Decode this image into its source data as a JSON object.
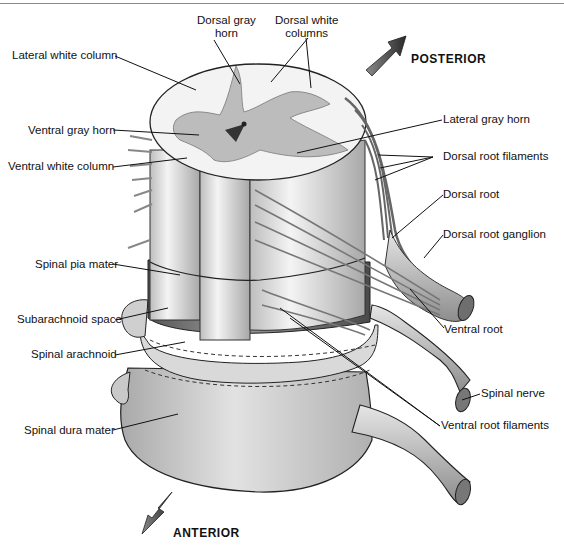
{
  "figure": {
    "directions": {
      "posterior": "POSTERIOR",
      "anterior": "ANTERIOR"
    },
    "labels": {
      "dorsal_gray_horn_1": "Dorsal gray",
      "dorsal_gray_horn_2": "horn",
      "dorsal_white_columns_1": "Dorsal white",
      "dorsal_white_columns_2": "columns",
      "lateral_white_column": "Lateral white column",
      "ventral_gray_horn": "Ventral gray horn",
      "ventral_white_column": "Ventral white column",
      "lateral_gray_horn": "Lateral gray horn",
      "dorsal_root_filaments": "Dorsal root filaments",
      "dorsal_root": "Dorsal root",
      "dorsal_root_ganglion": "Dorsal root ganglion",
      "spinal_pia_mater": "Spinal pia mater",
      "subarachnoid_space": "Subarachnoid space",
      "spinal_arachnoid": "Spinal arachnoid",
      "ventral_root": "Ventral root",
      "spinal_nerve": "Spinal nerve",
      "spinal_dura_mater": "Spinal dura mater",
      "ventral_root_filaments": "Ventral root filaments"
    },
    "colors": {
      "line": "#111111",
      "white_matter": "#f2f2f2",
      "gray_matter": "#b8b8b8",
      "pia": "#7a7a7a",
      "dura": "#d4d4d4",
      "arrow": "#3a3a3a"
    }
  }
}
